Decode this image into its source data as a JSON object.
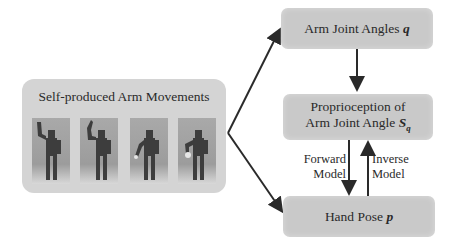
{
  "diagram": {
    "source_panel": {
      "title": "Self-produced Arm Movements",
      "images": [
        "robot-arm-raised-high",
        "robot-arm-raised",
        "robot-arm-low",
        "robot-arm-low-alt"
      ]
    },
    "nodes": {
      "arm_joint_angles": {
        "text": "Arm Joint Angles ",
        "symbol": "q"
      },
      "proprioception": {
        "line1": "Proprioception of",
        "line2": "Arm Joint Angle ",
        "symbol": "S",
        "subscript": "q"
      },
      "hand_pose": {
        "text": "Hand Pose ",
        "symbol": "p"
      }
    },
    "edge_labels": {
      "forward": {
        "line1": "Forward",
        "line2": "Model"
      },
      "inverse": {
        "line1": "Inverse",
        "line2": "Model"
      }
    },
    "colors": {
      "box": "#c9c9c9",
      "panel": "#d4d4d4",
      "arrow": "#2a2a2a"
    }
  }
}
